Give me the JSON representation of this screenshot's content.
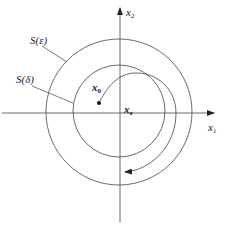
{
  "diagram": {
    "axes": {
      "x_label": "x",
      "x_sub": "1",
      "y_label": "x",
      "y_sub": "2"
    },
    "regions": [
      {
        "label": "S(ε)",
        "radius": 73
      },
      {
        "label": "S(δ)",
        "radius": 46
      }
    ],
    "points": {
      "start_label": "x",
      "start_sub": "0",
      "equilibrium_label": "x",
      "equilibrium_sub": "e"
    },
    "colors": {
      "stroke": "#333333",
      "background": "#ffffff"
    }
  }
}
